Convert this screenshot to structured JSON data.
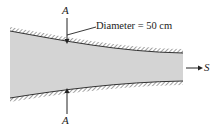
{
  "diagram": {
    "type": "converging-pipe-section",
    "section_label_top": "A",
    "section_label_bottom": "A",
    "dimension_label": "Diameter = 50 cm",
    "flow_direction_label": "S",
    "colors": {
      "fluid_fill": "#d4d4d4",
      "wall": "#333333",
      "text": "#222222",
      "background": "#ffffff"
    }
  }
}
